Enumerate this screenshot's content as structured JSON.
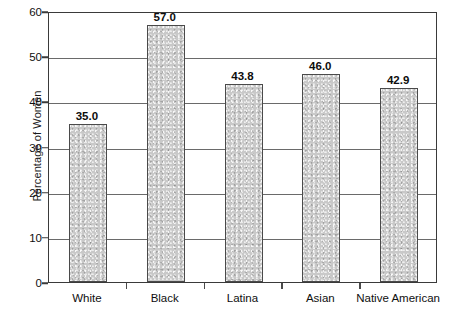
{
  "chart_data": {
    "type": "bar",
    "title": "",
    "xlabel": "",
    "ylabel": "Percentage of Women",
    "categories": [
      "White",
      "Black",
      "Latina",
      "Asian",
      "Native American"
    ],
    "values": [
      35.0,
      57.0,
      43.8,
      46.0,
      42.9
    ],
    "value_labels": [
      "35.0",
      "57.0",
      "43.8",
      "46.0",
      "42.9"
    ],
    "ylim": [
      0,
      60
    ],
    "yticks": [
      0,
      10,
      20,
      30,
      40,
      50,
      60
    ],
    "ytick_labels": [
      "0",
      "10",
      "20",
      "30",
      "40",
      "50",
      "60"
    ],
    "grid": true,
    "grid_axis": "y",
    "legend": false,
    "legend_position": "none",
    "series": [
      {
        "name": "Percentage of Women",
        "values": [
          35.0,
          57.0,
          43.8,
          46.0,
          42.9
        ]
      }
    ]
  },
  "style": {
    "bar_fill": "#c9c9c9",
    "bar_border": "#4a4a4a",
    "axis_color": "#3a3a3a",
    "grid_color": "#6a6a6a",
    "text_color": "#0f0f0f",
    "background": "#ffffff"
  }
}
